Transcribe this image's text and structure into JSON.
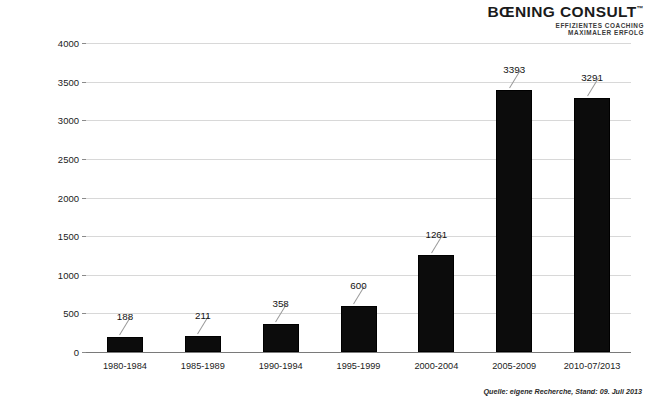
{
  "logo": {
    "name": "BŒNING CONSULT",
    "trademark": "™",
    "tagline_line1": "EFFIZIENTES COACHING",
    "tagline_line2": "MAXIMALER ERFOLG"
  },
  "source_note": "Quelle: eigene Recherche, Stand: 09. Juli 2013",
  "chart_data": {
    "type": "bar",
    "title": "",
    "xlabel": "",
    "ylabel": "Anzahl der Publikationen",
    "categories": [
      "1980-1984",
      "1985-1989",
      "1990-1994",
      "1995-1999",
      "2000-2004",
      "2005-2009",
      "2010-07/2013"
    ],
    "values": [
      188,
      211,
      358,
      600,
      1261,
      3393,
      3291
    ],
    "data_labels": [
      "188",
      "211",
      "358",
      "600",
      "1261",
      "3393",
      "3291"
    ],
    "ylim": [
      0,
      4000
    ],
    "yticks": [
      0,
      500,
      1000,
      1500,
      2000,
      2500,
      3000,
      3500,
      4000
    ],
    "ytick_labels": [
      "0",
      "500",
      "1000",
      "1500",
      "2000",
      "2500",
      "3000",
      "3500",
      "4000"
    ],
    "grid": true,
    "legend": false,
    "bar_color": "#0c0c0c"
  }
}
